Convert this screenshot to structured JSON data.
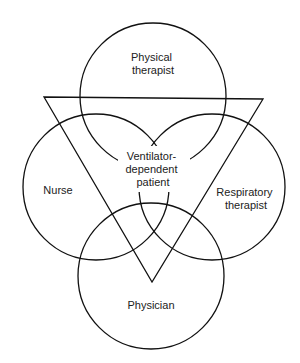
{
  "diagram": {
    "type": "venn-with-triangle",
    "center_label": [
      "Ventilator-",
      "dependent",
      "patient"
    ],
    "circles": [
      {
        "id": "physical-therapist",
        "label": [
          "Physical",
          "therapist"
        ],
        "cx": 153,
        "cy": 96,
        "r": 73
      },
      {
        "id": "nurse",
        "label": [
          "Nurse"
        ],
        "cx": 96,
        "cy": 187,
        "r": 73
      },
      {
        "id": "respiratory-therapist",
        "label": [
          "Respiratory",
          "therapist"
        ],
        "cx": 212,
        "cy": 187,
        "r": 73
      },
      {
        "id": "physician",
        "label": [
          "Physician"
        ],
        "cx": 151,
        "cy": 276,
        "r": 73
      }
    ],
    "triangle": {
      "points": [
        [
          44,
          97
        ],
        [
          263,
          99
        ],
        [
          152,
          282
        ]
      ]
    },
    "colors": {
      "stroke": "#111111",
      "text": "#222222",
      "background": "#ffffff"
    }
  }
}
